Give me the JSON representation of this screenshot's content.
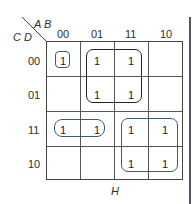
{
  "kmap": {
    "row_var_label": "C D",
    "col_var_label": "A B",
    "col_headers": [
      "00",
      "01",
      "11",
      "10"
    ],
    "row_headers": [
      "00",
      "01",
      "11",
      "10"
    ],
    "cells": [
      [
        "1",
        "1",
        "1",
        ""
      ],
      [
        "",
        "1",
        "1",
        ""
      ],
      [
        "1",
        "1",
        "1",
        "1"
      ],
      [
        "",
        "",
        "1",
        "1"
      ]
    ],
    "groups": [
      {
        "name": "group-single-00-00",
        "color": "#3a5a78",
        "cells": "CD=00, AB=00"
      },
      {
        "name": "group-quad-01-11",
        "color": "#222222",
        "cells": "CD=00..01, AB=01..11"
      },
      {
        "name": "group-pair-row-11",
        "color": "#3a5a78",
        "cells": "CD=11, AB=00..01"
      },
      {
        "name": "group-quad-bottom-right",
        "color": "#3a5a78",
        "cells": "CD=11..10, AB=11..10"
      }
    ],
    "caption": "H"
  }
}
